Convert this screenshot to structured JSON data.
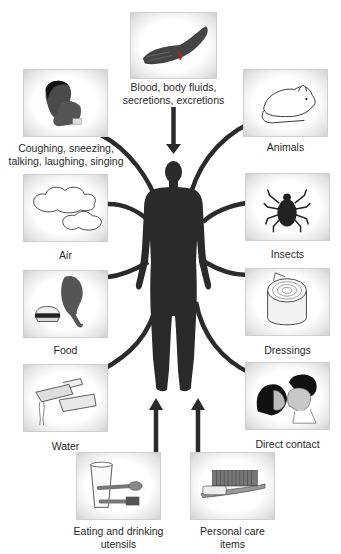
{
  "diagram": {
    "center": {
      "name": "human-body-silhouette"
    },
    "sources": [
      {
        "id": "blood",
        "label_line1": "Blood, body fluids,",
        "label_line2": "secretions, excretions",
        "icon": "bleeding-hand"
      },
      {
        "id": "coughing",
        "label_line1": "Coughing, sneezing,",
        "label_line2": "talking, laughing, singing",
        "icon": "person-coughing"
      },
      {
        "id": "animals",
        "label": "Animals",
        "icon": "rat"
      },
      {
        "id": "air",
        "label": "Air",
        "icon": "clouds"
      },
      {
        "id": "insects",
        "label": "Insects",
        "icon": "tick"
      },
      {
        "id": "food",
        "label": "Food",
        "icon": "chicken-leg-and-burger"
      },
      {
        "id": "dressings",
        "label": "Dressings",
        "icon": "bandage-roll"
      },
      {
        "id": "water",
        "label": "Water",
        "icon": "faucet"
      },
      {
        "id": "direct_contact",
        "label": "Direct contact",
        "icon": "couple-kissing"
      },
      {
        "id": "utensils",
        "label_line1": "Eating and drinking",
        "label_line2": "utensils",
        "icon": "glass-spoon-toothbrush"
      },
      {
        "id": "personal_care",
        "label_line1": "Personal care",
        "label_line2": "items",
        "icon": "comb-and-toothbrush"
      }
    ],
    "colors": {
      "connector": "#2b2b2b",
      "silhouette": "#2a2a2a",
      "box_edge": "#cfcfcf"
    }
  }
}
